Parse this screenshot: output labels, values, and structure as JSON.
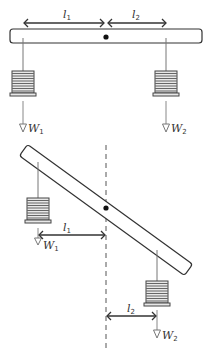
{
  "diagram": {
    "type": "lever-balance",
    "colors": {
      "line": "#333333",
      "string": "#666666",
      "weight_fill": "#e6e6e6",
      "weight_stripe": "#666666",
      "dash": "#555555"
    },
    "horizontal": {
      "label_l1": "l",
      "label_l1_sub": "1",
      "label_l2": "l",
      "label_l2_sub": "2",
      "label_w1": "W",
      "label_w1_sub": "1",
      "label_w2": "W",
      "label_w2_sub": "2"
    },
    "tilted": {
      "label_l1": "l",
      "label_l1_sub": "1",
      "label_l2": "l",
      "label_l2_sub": "2",
      "label_w1": "W",
      "label_w1_sub": "1",
      "label_w2": "W",
      "label_w2_sub": "2"
    }
  }
}
